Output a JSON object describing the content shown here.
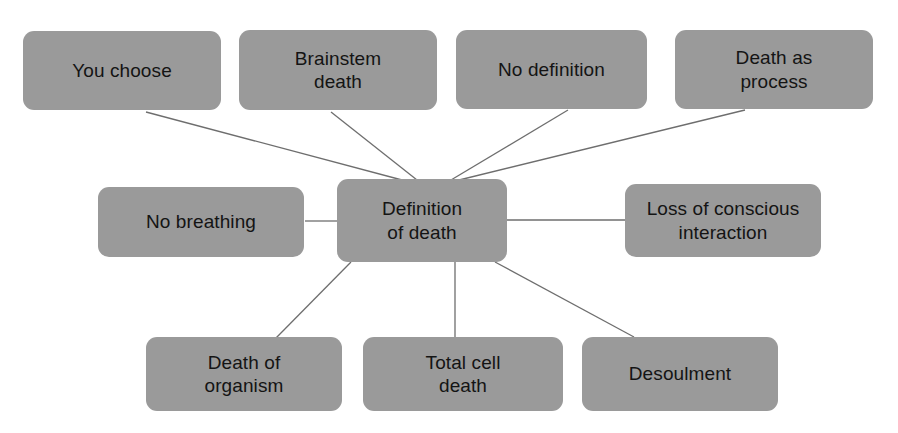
{
  "diagram": {
    "type": "mind-map",
    "title": "Definition of death",
    "central_node": {
      "id": "definition-of-death",
      "label": "Definition\nof death",
      "x": 337,
      "y": 179,
      "w": 170,
      "h": 83
    },
    "nodes": [
      {
        "id": "you-choose",
        "label": "You choose",
        "x": 23,
        "y": 31,
        "w": 198,
        "h": 79
      },
      {
        "id": "brainstem-death",
        "label": "Brainstem\ndeath",
        "x": 239,
        "y": 30,
        "w": 198,
        "h": 80
      },
      {
        "id": "no-definition",
        "label": "No definition",
        "x": 456,
        "y": 30,
        "w": 191,
        "h": 79
      },
      {
        "id": "death-as-process",
        "label": "Death as\nprocess",
        "x": 675,
        "y": 30,
        "w": 198,
        "h": 79
      },
      {
        "id": "no-breathing",
        "label": "No breathing",
        "x": 98,
        "y": 187,
        "w": 206,
        "h": 70
      },
      {
        "id": "loss-of-conscious-interaction",
        "label": "Loss of conscious\ninteraction",
        "x": 625,
        "y": 184,
        "w": 196,
        "h": 73
      },
      {
        "id": "death-of-organism",
        "label": "Death of\norganism",
        "x": 146,
        "y": 337,
        "w": 196,
        "h": 74
      },
      {
        "id": "total-cell-death",
        "label": "Total cell\ndeath",
        "x": 363,
        "y": 337,
        "w": 200,
        "h": 74
      },
      {
        "id": "desoulment",
        "label": "Desoulment",
        "x": 582,
        "y": 337,
        "w": 196,
        "h": 74
      }
    ],
    "edges": [
      {
        "id": "edge-you-choose",
        "from": "you-choose",
        "to": "definition-of-death",
        "x1": 146,
        "y1": 112,
        "x2": 402,
        "y2": 180
      },
      {
        "id": "edge-brainstem-death",
        "from": "brainstem-death",
        "to": "definition-of-death",
        "x1": 331,
        "y1": 112,
        "x2": 417,
        "y2": 180
      },
      {
        "id": "edge-no-definition",
        "from": "no-definition",
        "to": "definition-of-death",
        "x1": 568,
        "y1": 110,
        "x2": 451,
        "y2": 180
      },
      {
        "id": "edge-death-as-process",
        "from": "death-as-process",
        "to": "definition-of-death",
        "x1": 745,
        "y1": 110,
        "x2": 455,
        "y2": 181
      },
      {
        "id": "edge-no-breathing",
        "from": "no-breathing",
        "to": "definition-of-death",
        "x1": 305,
        "y1": 221,
        "x2": 337,
        "y2": 221
      },
      {
        "id": "edge-loss-of-conscious",
        "from": "loss-of-conscious-interaction",
        "to": "definition-of-death",
        "x1": 507,
        "y1": 220,
        "x2": 625,
        "y2": 220
      },
      {
        "id": "edge-death-of-organism",
        "from": "death-of-organism",
        "to": "definition-of-death",
        "x1": 276,
        "y1": 338,
        "x2": 351,
        "y2": 262
      },
      {
        "id": "edge-total-cell-death",
        "from": "total-cell-death",
        "to": "definition-of-death",
        "x1": 455,
        "y1": 338,
        "x2": 455,
        "y2": 262
      },
      {
        "id": "edge-desoulment",
        "from": "desoulment",
        "to": "definition-of-death",
        "x1": 634,
        "y1": 337,
        "x2": 495,
        "y2": 262
      }
    ],
    "colors": {
      "node_fill": "#9a9a9a",
      "node_text": "#141414",
      "edge_stroke": "#6e6e6e",
      "background": "#ffffff"
    }
  }
}
